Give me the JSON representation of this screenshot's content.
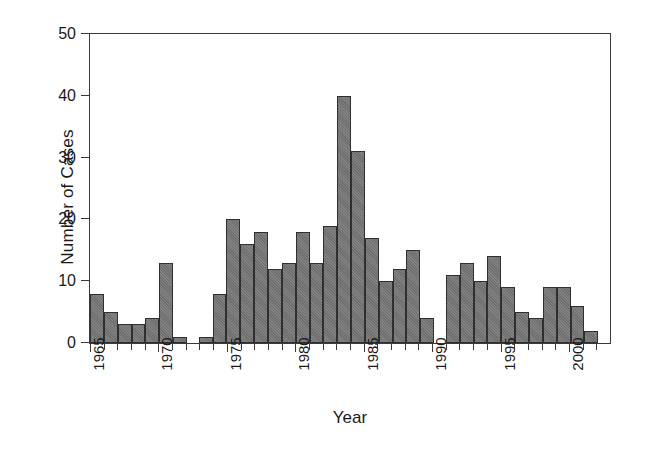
{
  "chart_data": {
    "type": "bar",
    "title": "",
    "subtitle": "",
    "xlabel": "Year",
    "ylabel": "Number of Cases",
    "ylim": [
      0,
      50
    ],
    "yticks": [
      0,
      10,
      20,
      30,
      40,
      50
    ],
    "xlim": [
      1964.5,
      2002.5
    ],
    "xticks": [
      1965,
      1970,
      1975,
      1980,
      1985,
      1990,
      1995,
      2000
    ],
    "xtick_labels": [
      "1965",
      "1970",
      "1975",
      "1980",
      "1985",
      "1990",
      "1995",
      "2000"
    ],
    "grid": false,
    "legend": null,
    "bar_color": "#6e6e6e",
    "bar_edge_color": "#2f2f2f",
    "axis_color": "#3a3a3a",
    "background": "#ffffff",
    "categories": [
      "1965",
      "1966",
      "1967",
      "1968",
      "1969",
      "1970",
      "1971",
      "1972",
      "1973",
      "1974",
      "1975",
      "1976",
      "1977",
      "1978",
      "1979",
      "1980",
      "1981",
      "1982",
      "1983",
      "1984",
      "1985",
      "1986",
      "1987",
      "1988",
      "1989",
      "1990",
      "1991",
      "1992",
      "1993",
      "1994",
      "1995",
      "1996",
      "1997",
      "1998",
      "1999",
      "2000",
      "2001",
      "2002"
    ],
    "values": [
      8,
      5,
      3,
      3,
      4,
      13,
      1,
      0,
      1,
      8,
      20,
      16,
      18,
      12,
      13,
      18,
      13,
      19,
      40,
      31,
      17,
      10,
      12,
      15,
      4,
      0,
      11,
      13,
      10,
      14,
      9,
      5,
      4,
      9,
      9,
      6,
      2,
      0
    ]
  }
}
